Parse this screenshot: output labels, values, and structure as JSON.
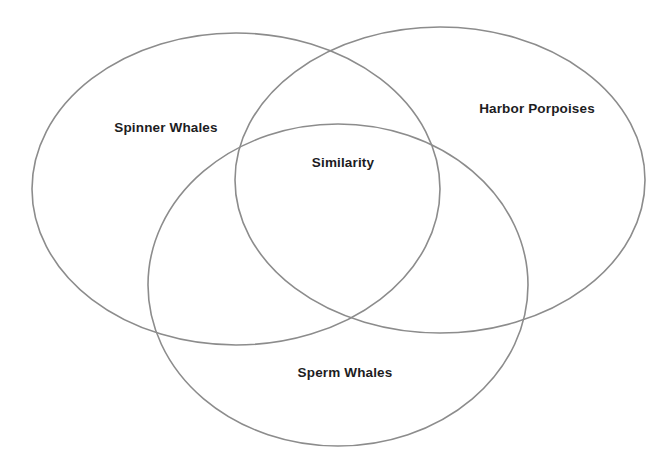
{
  "diagram": {
    "type": "venn-diagram",
    "background_color": "#ffffff",
    "stroke_color": "#8c8c8c",
    "text_color": "#1d1d1f",
    "sets": [
      {
        "id": "spinner-whales",
        "label": "Spinner Whales",
        "position": "top-left",
        "cx": 236,
        "cy": 189,
        "rx": 204,
        "ry": 156,
        "label_x": 166,
        "label_y": 128
      },
      {
        "id": "harbor-porpoises",
        "label": "Harbor Porpoises",
        "position": "top-right",
        "cx": 440,
        "cy": 180,
        "rx": 205,
        "ry": 153,
        "label_x": 537,
        "label_y": 109
      },
      {
        "id": "sperm-whales",
        "label": "Sperm Whales",
        "position": "bottom-center",
        "cx": 338,
        "cy": 285,
        "rx": 190,
        "ry": 161,
        "label_x": 345,
        "label_y": 373
      }
    ],
    "intersection": {
      "id": "similarity",
      "label": "Similarity",
      "description": "center region shared by all three sets",
      "label_x": 343,
      "label_y": 163
    }
  }
}
